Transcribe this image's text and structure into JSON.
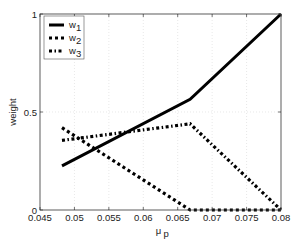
{
  "chart_data": {
    "type": "line",
    "title": "",
    "xlabel": "μ",
    "xlabel_sub": "p",
    "ylabel": "weight",
    "xlim": [
      0.045,
      0.08
    ],
    "ylim": [
      0,
      1
    ],
    "xticks": [
      0.045,
      0.05,
      0.055,
      0.06,
      0.065,
      0.07,
      0.075,
      0.08
    ],
    "xtick_labels": [
      "0.045",
      "0.05",
      "0.055",
      "0.06",
      "0.065",
      "0.07",
      "0.075",
      "0.08"
    ],
    "yticks": [
      0,
      0.5,
      1
    ],
    "ytick_labels": [
      "0",
      "0.5",
      "1"
    ],
    "grid": true,
    "legend_position": "upper left",
    "series": [
      {
        "name": "w1",
        "label_main": "w",
        "label_sub": "1",
        "style": "solid",
        "x": [
          0.0482,
          0.0668,
          0.08
        ],
        "y": [
          0.225,
          0.565,
          1.0
        ]
      },
      {
        "name": "w2",
        "label_main": "w",
        "label_sub": "2",
        "style": "dotted",
        "x": [
          0.0482,
          0.0668,
          0.08
        ],
        "y": [
          0.42,
          0.0,
          0.0
        ]
      },
      {
        "name": "w3",
        "label_main": "w",
        "label_sub": "3",
        "style": "dash-dot",
        "x": [
          0.0482,
          0.0668,
          0.08
        ],
        "y": [
          0.355,
          0.44,
          0.0
        ]
      }
    ]
  },
  "colors": {
    "line": "#000000",
    "axis": "#222222",
    "grid": "#d8d8d8",
    "background": "#ffffff"
  }
}
